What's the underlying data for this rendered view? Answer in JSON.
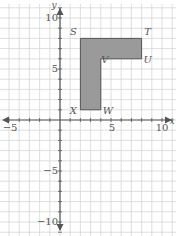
{
  "figure": {
    "type": "coordinate-plane",
    "x_axis": {
      "name": "x",
      "range": [
        -6,
        11
      ],
      "tick_labels": [
        {
          "value": -5,
          "label": "−5"
        },
        {
          "value": 5,
          "label": "5"
        },
        {
          "value": 10,
          "label": "10"
        }
      ]
    },
    "y_axis": {
      "name": "y",
      "range": [
        -11,
        11
      ],
      "tick_labels": [
        {
          "value": 10,
          "label": "10"
        },
        {
          "value": 5,
          "label": "5"
        },
        {
          "value": -5,
          "label": "−5"
        },
        {
          "value": -10,
          "label": "−10"
        }
      ]
    },
    "grid": true,
    "shape": {
      "fill": "#9a9a9a",
      "stroke": "#555555",
      "vertices": [
        {
          "name": "S",
          "x": 2,
          "y": 8
        },
        {
          "name": "T",
          "x": 8,
          "y": 8
        },
        {
          "name": "U",
          "x": 8,
          "y": 6
        },
        {
          "name": "V",
          "x": 4,
          "y": 6
        },
        {
          "name": "W",
          "x": 4,
          "y": 1
        },
        {
          "name": "X",
          "x": 2,
          "y": 1
        }
      ]
    },
    "colors": {
      "grid": "#d6d6d6",
      "axis": "#555555",
      "text": "#555555"
    }
  }
}
